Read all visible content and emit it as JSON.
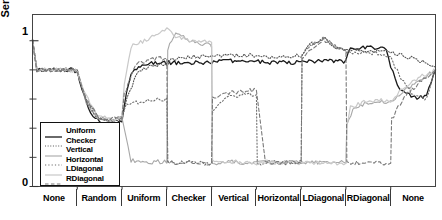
{
  "axes": {
    "ylabel": "Sensitivity",
    "ytick_top": "1",
    "ytick_bottom": "0"
  },
  "legend": {
    "items": [
      {
        "label": "Uniform",
        "color": "#1a1a1a",
        "style": "solid",
        "width": 1.3
      },
      {
        "label": "Checker",
        "color": "#555555",
        "style": "fine-dotted",
        "width": 1.1
      },
      {
        "label": "Vertical",
        "color": "#a8a8a8",
        "style": "solid",
        "width": 1.1
      },
      {
        "label": "Horizontal",
        "color": "#6f6f6f",
        "style": "dotted",
        "width": 1.1
      },
      {
        "label": "LDiagonal",
        "color": "#c9c9c9",
        "style": "solid",
        "width": 1.2
      },
      {
        "label": "RDiagonal",
        "color": "#7a7a7a",
        "style": "dashed",
        "width": 1.1
      }
    ]
  },
  "chart_data": {
    "type": "line",
    "title": "",
    "xlabel": "",
    "ylabel": "Sensitivity",
    "ylim": [
      0,
      1.18
    ],
    "yticks": [
      0,
      1
    ],
    "ytick_labels": [
      "0",
      "1"
    ],
    "grid": false,
    "legend_position": "lower-left-inside",
    "x_categories": [
      "None",
      "Random",
      "Uniform",
      "Checker",
      "Vertical",
      "Horizontal",
      "LDiagonal",
      "RDiagonal",
      "None"
    ],
    "x_segment_count": 9,
    "x_range": [
      0,
      9
    ],
    "series": [
      {
        "name": "Uniform",
        "color": "#1a1a1a",
        "style": "solid",
        "x": [
          0,
          0.1,
          0.3,
          0.6,
          0.9,
          1.0,
          1.15,
          1.35,
          1.55,
          1.75,
          1.95,
          2.0,
          2.05,
          2.2,
          2.45,
          2.7,
          2.95,
          3.0,
          3.3,
          3.6,
          3.9,
          4.0,
          4.3,
          4.6,
          4.9,
          5.0,
          5.3,
          5.6,
          5.9,
          6.0,
          6.05,
          6.3,
          6.6,
          6.9,
          7.0,
          7.1,
          7.3,
          7.6,
          7.9,
          8.0,
          8.2,
          8.5,
          8.8,
          9.0
        ],
        "y": [
          1.0,
          0.8,
          0.8,
          0.8,
          0.8,
          0.79,
          0.62,
          0.48,
          0.44,
          0.43,
          0.44,
          0.45,
          0.56,
          0.78,
          0.84,
          0.85,
          0.85,
          0.85,
          0.85,
          0.85,
          0.85,
          0.85,
          0.86,
          0.86,
          0.86,
          0.86,
          0.85,
          0.85,
          0.85,
          0.85,
          0.86,
          0.86,
          0.86,
          0.86,
          0.86,
          0.95,
          0.95,
          0.95,
          0.95,
          0.82,
          0.66,
          0.61,
          0.62,
          0.8
        ]
      },
      {
        "name": "Checker",
        "color": "#555555",
        "style": "fine-dotted",
        "x": [
          0,
          0.1,
          0.4,
          0.8,
          1.0,
          1.2,
          1.45,
          1.7,
          1.95,
          2.0,
          2.1,
          2.35,
          2.65,
          2.95,
          3.0,
          3.05,
          3.3,
          3.6,
          3.9,
          4.0,
          4.3,
          4.6,
          4.9,
          5.0,
          5.3,
          5.6,
          5.9,
          6.0,
          6.2,
          6.5,
          6.8,
          7.0,
          7.1,
          7.4,
          7.7,
          8.0,
          8.2,
          8.5,
          8.8,
          9.0
        ],
        "y": [
          1.0,
          0.8,
          0.8,
          0.8,
          0.79,
          0.6,
          0.47,
          0.45,
          0.46,
          0.47,
          0.6,
          0.79,
          0.83,
          0.84,
          0.84,
          0.86,
          0.88,
          0.89,
          0.89,
          0.89,
          0.9,
          0.9,
          0.9,
          0.9,
          0.89,
          0.89,
          0.9,
          0.9,
          0.97,
          1.02,
          0.95,
          0.94,
          0.93,
          0.93,
          0.93,
          0.92,
          0.9,
          0.88,
          0.85,
          0.82
        ]
      },
      {
        "name": "Vertical",
        "color": "#a8a8a8",
        "style": "solid",
        "x": [
          0,
          0.1,
          0.4,
          0.8,
          1.0,
          1.2,
          1.45,
          1.7,
          1.95,
          2.0,
          2.2,
          2.5,
          2.8,
          2.95,
          3.0,
          3.02,
          3.2,
          3.5,
          3.8,
          3.98,
          4.0,
          4.02,
          4.2,
          4.5,
          4.8,
          5.0,
          5.2,
          5.5,
          5.8,
          6.0,
          6.2,
          6.5,
          6.8,
          7.0,
          7.02,
          7.2,
          7.5,
          7.8,
          8.0,
          8.1,
          8.4,
          8.7,
          9.0
        ],
        "y": [
          1.0,
          0.8,
          0.8,
          0.8,
          0.79,
          0.58,
          0.47,
          0.45,
          0.46,
          0.47,
          0.18,
          0.16,
          0.17,
          0.17,
          0.16,
          0.94,
          1.06,
          1.0,
          0.98,
          0.97,
          0.96,
          0.16,
          0.16,
          0.17,
          0.16,
          0.16,
          0.17,
          0.16,
          0.17,
          0.16,
          0.17,
          0.16,
          0.17,
          0.16,
          0.42,
          0.55,
          0.57,
          0.58,
          0.58,
          0.6,
          0.68,
          0.74,
          0.8
        ]
      },
      {
        "name": "Horizontal",
        "color": "#6f6f6f",
        "style": "dotted",
        "x": [
          0,
          0.1,
          0.4,
          0.8,
          1.0,
          1.2,
          1.45,
          1.7,
          1.95,
          2.0,
          2.1,
          2.4,
          2.7,
          2.98,
          3.0,
          3.02,
          3.2,
          3.5,
          3.8,
          4.0,
          4.02,
          4.2,
          4.5,
          4.8,
          5.0,
          5.02,
          5.1,
          5.4,
          5.7,
          5.98,
          6.0,
          6.02,
          6.2,
          6.5,
          6.8,
          7.0,
          7.02,
          7.2,
          7.5,
          7.8,
          8.0,
          8.2,
          8.5,
          8.8,
          9.0
        ],
        "y": [
          1.0,
          0.8,
          0.8,
          0.8,
          0.79,
          0.58,
          0.47,
          0.45,
          0.47,
          0.48,
          0.56,
          0.58,
          0.59,
          0.6,
          0.6,
          0.17,
          0.16,
          0.17,
          0.16,
          0.16,
          0.5,
          0.59,
          0.62,
          0.63,
          0.63,
          0.16,
          0.16,
          0.17,
          0.16,
          0.17,
          0.17,
          0.92,
          0.96,
          1.02,
          0.95,
          0.93,
          0.92,
          0.92,
          0.92,
          0.91,
          0.88,
          0.76,
          0.62,
          0.6,
          0.8
        ]
      },
      {
        "name": "LDiagonal",
        "color": "#c9c9c9",
        "style": "solid",
        "x": [
          0,
          0.1,
          0.4,
          0.8,
          1.0,
          1.2,
          1.45,
          1.7,
          1.95,
          2.0,
          2.05,
          2.2,
          2.5,
          2.8,
          3.0,
          3.2,
          3.5,
          3.8,
          4.0,
          4.02,
          4.2,
          4.5,
          4.8,
          5.0,
          5.2,
          5.5,
          5.8,
          6.0,
          6.02,
          6.2,
          6.5,
          6.8,
          7.0,
          7.02,
          7.1,
          7.4,
          7.7,
          8.0,
          8.1,
          8.4,
          8.7,
          9.0
        ],
        "y": [
          1.0,
          0.8,
          0.8,
          0.8,
          0.79,
          0.62,
          0.49,
          0.46,
          0.47,
          0.48,
          0.7,
          0.96,
          1.0,
          1.05,
          1.09,
          1.03,
          1.0,
          1.0,
          0.99,
          0.17,
          0.16,
          0.17,
          0.16,
          0.16,
          0.17,
          0.16,
          0.17,
          0.16,
          0.17,
          0.16,
          0.17,
          0.16,
          0.16,
          0.42,
          0.54,
          0.58,
          0.59,
          0.59,
          0.62,
          0.7,
          0.76,
          0.8
        ]
      },
      {
        "name": "RDiagonal",
        "color": "#7a7a7a",
        "style": "dashed",
        "x": [
          0,
          0.1,
          0.4,
          0.8,
          1.0,
          1.2,
          1.45,
          1.7,
          1.95,
          2.0,
          2.05,
          2.3,
          2.6,
          2.9,
          3.0,
          3.02,
          3.2,
          3.5,
          3.8,
          4.0,
          4.02,
          4.3,
          4.6,
          4.9,
          5.0,
          5.2,
          5.5,
          5.8,
          6.0,
          6.02,
          6.2,
          6.5,
          6.8,
          7.0,
          7.02,
          7.2,
          7.5,
          7.8,
          8.0,
          8.02,
          8.3,
          8.6,
          9.0
        ],
        "y": [
          1.0,
          0.8,
          0.8,
          0.8,
          0.79,
          0.6,
          0.48,
          0.46,
          0.47,
          0.48,
          0.63,
          0.84,
          0.87,
          0.88,
          0.88,
          0.17,
          0.16,
          0.17,
          0.16,
          0.16,
          0.6,
          0.64,
          0.65,
          0.66,
          0.66,
          0.17,
          0.16,
          0.17,
          0.16,
          0.88,
          0.94,
          1.01,
          0.95,
          0.93,
          0.17,
          0.16,
          0.17,
          0.16,
          0.16,
          0.46,
          0.62,
          0.7,
          0.8
        ]
      }
    ]
  }
}
